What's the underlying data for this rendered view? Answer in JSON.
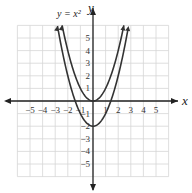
{
  "chart_data": {
    "type": "line",
    "title": "",
    "xlabel": "x",
    "ylabel": "y",
    "xlim": [
      -6,
      6
    ],
    "ylim": [
      -6,
      6
    ],
    "grid": true,
    "x_ticks": [
      "-5",
      "-4",
      "-3",
      "-2",
      "-1",
      "1",
      "2",
      "3",
      "4",
      "5"
    ],
    "y_ticks": [
      "5",
      "4",
      "3",
      "2",
      "1",
      "-1",
      "-2",
      "-3",
      "-4",
      "-5"
    ],
    "annotations": [
      {
        "text": "y = x²",
        "attached_to": "y = x^2"
      }
    ],
    "series": [
      {
        "name": "y = x^2",
        "function": "x^2",
        "vertex": [
          0,
          0
        ],
        "x": [
          -2.4,
          -2,
          -1,
          0,
          1,
          2,
          2.4
        ],
        "y": [
          5.76,
          4,
          1,
          0,
          1,
          4,
          5.76
        ]
      },
      {
        "name": "y = x^2 - 2",
        "function": "x^2 - 2",
        "vertex": [
          0,
          -2
        ],
        "x": [
          -2.8,
          -2,
          -1,
          0,
          1,
          2,
          2.8
        ],
        "y": [
          5.84,
          2,
          -1,
          -2,
          -1,
          2,
          5.84
        ]
      }
    ]
  },
  "labels": {
    "x_axis": "x",
    "y_axis": "y",
    "equation": "y = x²"
  }
}
